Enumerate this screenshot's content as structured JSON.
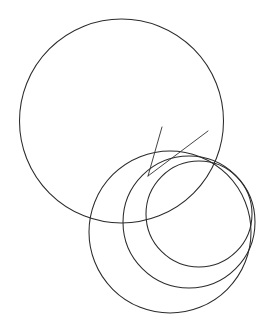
{
  "figure": {
    "kind": "line-drawing",
    "background_color": "#ffffff",
    "stroke_color": "#2b2b2b",
    "line_color": "#3a3a3a",
    "canvas": {
      "width": 276,
      "height": 331
    },
    "stroke_width": 1.05,
    "element_counts": {
      "circles": 4,
      "straight_lines": 2,
      "convergence_points": 2
    }
  },
  "chart_data": {
    "type": "scatter",
    "xlabel": "",
    "ylabel": "",
    "xlim": [
      0,
      276
    ],
    "ylim": [
      0,
      331
    ],
    "grid": false,
    "legend": "none",
    "circles": [
      {
        "name": "large-circle",
        "cx": 121.5,
        "cy": 121.0,
        "r": 102.0,
        "bbox": {
          "left": 19.5,
          "top": 19.0,
          "right": 223.5,
          "bottom": 223.0
        },
        "stroke": "#2b2b2b"
      },
      {
        "name": "small-circle-outer-right",
        "cx": 199.0,
        "cy": 214.0,
        "r": 53.0,
        "bbox": {
          "left": 146.0,
          "top": 161.0,
          "right": 252.0,
          "bottom": 267.0
        },
        "stroke": "#2b2b2b"
      },
      {
        "name": "small-circle-middle",
        "cx": 189.0,
        "cy": 222.0,
        "r": 66.0,
        "bbox": {
          "left": 123.0,
          "top": 156.0,
          "right": 255.0,
          "bottom": 288.0
        },
        "stroke": "#2b2b2b"
      },
      {
        "name": "small-circle-lower-left",
        "cx": 170.0,
        "cy": 232.0,
        "r": 81.0,
        "bbox": {
          "left": 89.0,
          "top": 151.0,
          "right": 251.0,
          "bottom": 313.0
        },
        "stroke": "#2b2b2b"
      }
    ],
    "lines": [
      {
        "name": "steep-radiating-line",
        "x1": 148.0,
        "y1": 176.0,
        "x2": 162.0,
        "y2": 127.0,
        "stroke": "#3a3a3a"
      },
      {
        "name": "diagonal-radiating-line",
        "x1": 148.0,
        "y1": 176.0,
        "x2": 208.0,
        "y2": 131.0,
        "stroke": "#3a3a3a"
      }
    ],
    "points": [
      {
        "name": "upper-convergence-point",
        "x": 148.0,
        "y": 176.0
      },
      {
        "name": "lower-convergence-point",
        "x": 228.0,
        "y": 266.0
      }
    ]
  }
}
